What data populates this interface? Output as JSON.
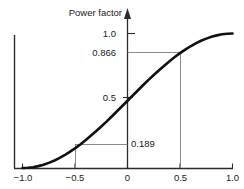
{
  "chart_data": {
    "type": "line",
    "title": "Power factor",
    "xlabel": "",
    "ylabel": "",
    "xlim": [
      -1.0,
      1.0
    ],
    "ylim": [
      0.0,
      1.0
    ],
    "grid": false,
    "legend": null,
    "x_ticks": [
      {
        "value": -1.0,
        "label": "−1.0"
      },
      {
        "value": -0.5,
        "label": "−0.5"
      },
      {
        "value": 0.0,
        "label": "0"
      },
      {
        "value": 0.5,
        "label": "0.5"
      },
      {
        "value": 1.0,
        "label": "1.0"
      }
    ],
    "y_ticks": [
      {
        "value": 1.0,
        "label": "1.0"
      },
      {
        "value": 0.866,
        "label": "0.866"
      },
      {
        "value": 0.5,
        "label": "0.5"
      }
    ],
    "annotations": [
      {
        "label": "0.189",
        "x": -0.5,
        "y": 0.189
      },
      {
        "label": "0.866",
        "x": 0.5,
        "y": 0.866
      },
      {
        "label": "0.5",
        "x": 0.0,
        "y": 0.5
      },
      {
        "label": "1.0",
        "x": null,
        "y": 1.0
      }
    ],
    "series": [
      {
        "name": "Power factor",
        "color": "#111111",
        "x": [
          -1.0,
          -0.95,
          -0.9,
          -0.85,
          -0.8,
          -0.75,
          -0.7,
          -0.65,
          -0.6,
          -0.55,
          -0.5,
          -0.45,
          -0.4,
          -0.35,
          -0.3,
          -0.25,
          -0.2,
          -0.15,
          -0.1,
          -0.05,
          0.0,
          0.05,
          0.1,
          0.15,
          0.2,
          0.25,
          0.3,
          0.35,
          0.4,
          0.45,
          0.5,
          0.55,
          0.6,
          0.65,
          0.7,
          0.75,
          0.8,
          0.85,
          0.9,
          0.95,
          1.0
        ],
        "y": [
          0.0,
          0.002,
          0.006,
          0.014,
          0.024,
          0.038,
          0.054,
          0.073,
          0.095,
          0.12,
          0.146,
          0.175,
          0.206,
          0.239,
          0.273,
          0.309,
          0.345,
          0.383,
          0.422,
          0.461,
          0.5,
          0.539,
          0.578,
          0.617,
          0.655,
          0.691,
          0.727,
          0.761,
          0.794,
          0.825,
          0.854,
          0.88,
          0.905,
          0.927,
          0.946,
          0.962,
          0.976,
          0.986,
          0.994,
          0.998,
          1.0
        ]
      }
    ]
  },
  "axes": {
    "y_axis_arrow": "arrow-up",
    "leader_lines": [
      {
        "from": "y-axis",
        "to_x": 0.5,
        "at_y": 0.866
      },
      {
        "from": "curve",
        "to_x": -0.5,
        "at_y": 0.189
      },
      {
        "drop": true,
        "x": 0.5,
        "from_y": 0.866,
        "to_y": 0.0
      },
      {
        "drop": true,
        "x": -0.5,
        "from_y": 0.189,
        "to_y": 0.0
      }
    ]
  }
}
